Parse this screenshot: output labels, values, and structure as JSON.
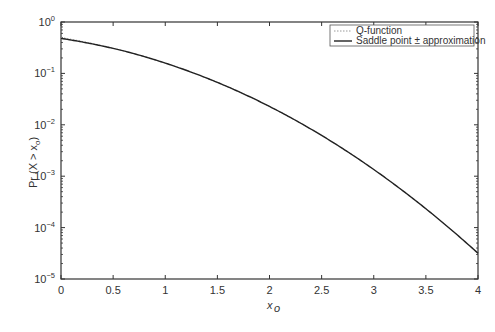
{
  "chart_data": {
    "type": "line",
    "title": "",
    "xlabel": "x_o",
    "ylabel": "Pr(X > x_o)",
    "xlim": [
      0,
      4
    ],
    "ylim": [
      1e-05,
      1
    ],
    "yscale": "log",
    "grid": false,
    "legend_position": "upper right",
    "x_ticks": [
      "0",
      "0.5",
      "1",
      "1.5",
      "2",
      "2.5",
      "3",
      "3.5",
      "4"
    ],
    "y_ticks": [
      {
        "base": "10",
        "exp": "0",
        "value": 1
      },
      {
        "base": "10",
        "exp": "−1",
        "value": 0.1
      },
      {
        "base": "10",
        "exp": "−2",
        "value": 0.01
      },
      {
        "base": "10",
        "exp": "−3",
        "value": 0.001
      },
      {
        "base": "10",
        "exp": "−4",
        "value": 0.0001
      },
      {
        "base": "10",
        "exp": "−5",
        "value": 1e-05
      }
    ],
    "x": [
      0,
      0.25,
      0.5,
      0.75,
      1,
      1.25,
      1.5,
      1.75,
      2,
      2.25,
      2.5,
      2.75,
      3,
      3.25,
      3.5,
      3.75,
      4
    ],
    "series": [
      {
        "name": "Q-function",
        "style": "dotted",
        "color": "#999999",
        "values": [
          0.5,
          0.401,
          0.3085,
          0.2266,
          0.1587,
          0.1056,
          0.0668,
          0.0401,
          0.02275,
          0.01222,
          0.00621,
          0.00298,
          0.00135,
          0.000577,
          0.000233,
          8.84e-05,
          3.17e-05
        ]
      },
      {
        "name": "Saddle point ± approximation",
        "style": "solid",
        "color": "#222222",
        "values": [
          0.48,
          0.395,
          0.305,
          0.224,
          0.157,
          0.105,
          0.0665,
          0.0399,
          0.0227,
          0.0122,
          0.0062,
          0.00297,
          0.00134,
          0.000574,
          0.000232,
          8.8e-05,
          3.15e-05
        ]
      }
    ]
  },
  "legend": {
    "items": [
      {
        "label": "Q-function"
      },
      {
        "label": "Saddle point ± approximation"
      }
    ]
  },
  "axes": {
    "xlabel_main": "x",
    "xlabel_sub": "o",
    "ylabel_prefix": "Pr (X > x",
    "ylabel_sub": "o",
    "ylabel_suffix": ")"
  }
}
